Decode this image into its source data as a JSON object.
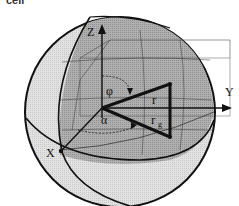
{
  "caption": "cell",
  "axes": {
    "x": "X",
    "y": "Y",
    "z": "Z"
  },
  "angles": {
    "phi": "φ",
    "alpha": "α"
  },
  "vectors": {
    "r": "r",
    "rg_main": "r",
    "rg_sub": "g"
  },
  "colors": {
    "outer_shade": "#d9d9d9",
    "inner_shade": "#a6a6a6",
    "line": "#111111"
  }
}
